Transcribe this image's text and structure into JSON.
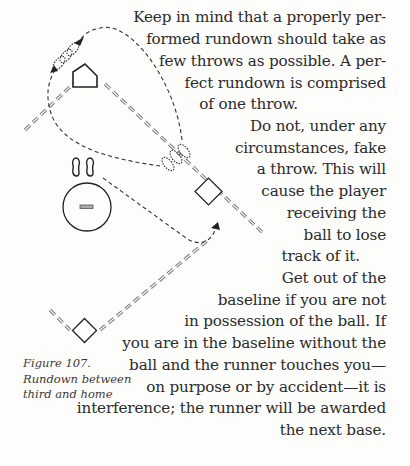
{
  "body_text": {
    "lines": [
      "Keep in mind that a properly per-",
      "formed rundown should take as",
      "few throws as possible. A per-",
      "fect rundown is comprised",
      "of one throw.",
      "Do not, under any",
      "circumstances,  fake",
      "a throw. This will",
      "cause the player",
      "receiving  the",
      "ball  to  lose",
      "track of it.",
      "Get out of the",
      "baseline if you are not",
      "in possession of the ball. If",
      "you are in the baseline without the",
      "ball and the runner touches you—",
      "on purpose or by accident—it is",
      "interference; the runner will be awarded",
      "the next base."
    ]
  },
  "figure": {
    "caption_lines": [
      "Figure 107.",
      "Rundown between",
      "third and home"
    ],
    "icons": [
      "home-plate-icon",
      "third-base-icon",
      "second-base-icon",
      "pitchers-mound-icon",
      "footprints-icon",
      "runner-path-arrow-icon"
    ]
  }
}
